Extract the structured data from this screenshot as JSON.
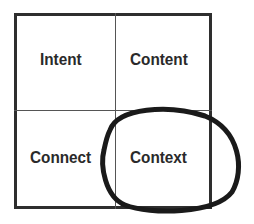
{
  "diagram": {
    "cells": [
      {
        "label": "Intent",
        "position": "top-left"
      },
      {
        "label": "Content",
        "position": "top-right"
      },
      {
        "label": "Connect",
        "position": "bottom-left"
      },
      {
        "label": "Context",
        "position": "bottom-right",
        "highlighted": true
      }
    ],
    "colors": {
      "border": "#2e2e2e",
      "text": "#2a2a2a",
      "highlight_ellipse": "#1a1a1a"
    }
  }
}
